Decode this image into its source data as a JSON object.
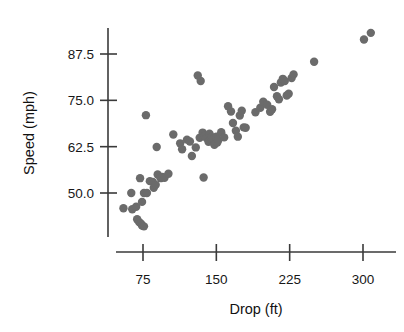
{
  "chart_data": {
    "type": "scatter",
    "title": "",
    "xlabel": "Drop (ft)",
    "ylabel": "Speed (mph)",
    "xticks": [
      75,
      150,
      225,
      300
    ],
    "xticklabels": [
      "75",
      "150",
      "225",
      "300"
    ],
    "yticks": [
      50.0,
      62.5,
      75.0,
      87.5
    ],
    "yticklabels": [
      "50.0",
      "62.5",
      "75.0",
      "87.5"
    ],
    "xlim": [
      45,
      320
    ],
    "ylim": [
      40.5,
      94
    ],
    "grid": false,
    "legend": null,
    "marker": {
      "shape": "circle",
      "color": "#6b6b6b",
      "radius_px": 4.2
    },
    "points": [
      {
        "x": 55,
        "y": 45.9
      },
      {
        "x": 63,
        "y": 50.0
      },
      {
        "x": 64,
        "y": 45.6
      },
      {
        "x": 68,
        "y": 46.3
      },
      {
        "x": 69,
        "y": 42.9
      },
      {
        "x": 71,
        "y": 42.2
      },
      {
        "x": 73,
        "y": 41.7
      },
      {
        "x": 74,
        "y": 41.2
      },
      {
        "x": 76,
        "y": 41.0
      },
      {
        "x": 74,
        "y": 47.6
      },
      {
        "x": 76,
        "y": 50.0
      },
      {
        "x": 79,
        "y": 50.0
      },
      {
        "x": 72,
        "y": 54.0
      },
      {
        "x": 78,
        "y": 71.0
      },
      {
        "x": 82,
        "y": 53.2
      },
      {
        "x": 85,
        "y": 53.0
      },
      {
        "x": 86,
        "y": 51.4
      },
      {
        "x": 88,
        "y": 52.2
      },
      {
        "x": 90,
        "y": 55.0
      },
      {
        "x": 93,
        "y": 54.0
      },
      {
        "x": 95,
        "y": 54.3
      },
      {
        "x": 97,
        "y": 54.1
      },
      {
        "x": 89,
        "y": 62.4
      },
      {
        "x": 101,
        "y": 55.2
      },
      {
        "x": 106,
        "y": 65.8
      },
      {
        "x": 113,
        "y": 63.4
      },
      {
        "x": 115,
        "y": 61.8
      },
      {
        "x": 120,
        "y": 64.4
      },
      {
        "x": 123,
        "y": 63.9
      },
      {
        "x": 125,
        "y": 60.0
      },
      {
        "x": 129,
        "y": 62.3
      },
      {
        "x": 131,
        "y": 81.7
      },
      {
        "x": 134,
        "y": 80.2
      },
      {
        "x": 133,
        "y": 64.9
      },
      {
        "x": 136,
        "y": 66.3
      },
      {
        "x": 138,
        "y": 65.4
      },
      {
        "x": 140,
        "y": 64.8
      },
      {
        "x": 142,
        "y": 63.8
      },
      {
        "x": 143,
        "y": 66.0
      },
      {
        "x": 145,
        "y": 65.1
      },
      {
        "x": 146,
        "y": 63.9
      },
      {
        "x": 147,
        "y": 64.6
      },
      {
        "x": 148,
        "y": 63.0
      },
      {
        "x": 150,
        "y": 65.2
      },
      {
        "x": 151,
        "y": 63.6
      },
      {
        "x": 152,
        "y": 64.3
      },
      {
        "x": 137,
        "y": 54.2
      },
      {
        "x": 155,
        "y": 66.4
      },
      {
        "x": 158,
        "y": 65.0
      },
      {
        "x": 162,
        "y": 73.4
      },
      {
        "x": 165,
        "y": 72.0
      },
      {
        "x": 167,
        "y": 68.9
      },
      {
        "x": 170,
        "y": 66.8
      },
      {
        "x": 172,
        "y": 65.2
      },
      {
        "x": 174,
        "y": 70.9
      },
      {
        "x": 176,
        "y": 72.2
      },
      {
        "x": 178,
        "y": 67.7
      },
      {
        "x": 180,
        "y": 67.6
      },
      {
        "x": 190,
        "y": 71.8
      },
      {
        "x": 195,
        "y": 73.0
      },
      {
        "x": 198,
        "y": 74.6
      },
      {
        "x": 202,
        "y": 73.8
      },
      {
        "x": 205,
        "y": 71.9
      },
      {
        "x": 207,
        "y": 72.6
      },
      {
        "x": 209,
        "y": 78.6
      },
      {
        "x": 212,
        "y": 76.1
      },
      {
        "x": 214,
        "y": 75.3
      },
      {
        "x": 216,
        "y": 79.8
      },
      {
        "x": 218,
        "y": 80.8
      },
      {
        "x": 220,
        "y": 80.2
      },
      {
        "x": 222,
        "y": 76.3
      },
      {
        "x": 224,
        "y": 76.8
      },
      {
        "x": 227,
        "y": 81.0
      },
      {
        "x": 229,
        "y": 82.0
      },
      {
        "x": 250,
        "y": 85.4
      },
      {
        "x": 301,
        "y": 91.4
      },
      {
        "x": 308,
        "y": 93.2
      }
    ]
  },
  "axes": {
    "x_axis_name": "x-axis",
    "y_axis_name": "y-axis"
  }
}
